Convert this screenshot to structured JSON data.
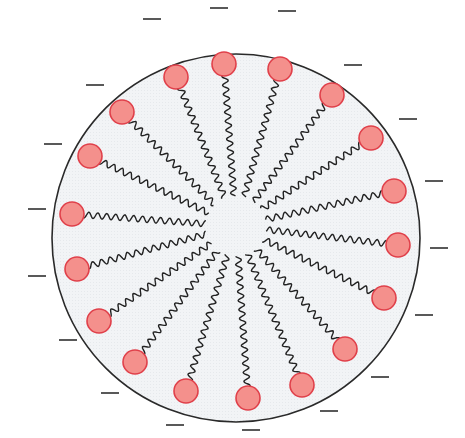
{
  "diagram": {
    "type": "micelle",
    "colors": {
      "background": "#ffffff",
      "interior": "#f2f4f6",
      "boundary": "#2a2a2a",
      "head_fill": "#f4908c",
      "head_stroke": "#e0404a",
      "tail": "#222222",
      "charge": "#222222"
    },
    "boundary": {
      "cx": 236,
      "cy": 238,
      "r": 184
    },
    "center": {
      "x": 236,
      "y": 226
    },
    "heads": [
      {
        "x": 176,
        "y": 77
      },
      {
        "x": 224,
        "y": 64
      },
      {
        "x": 280,
        "y": 69
      },
      {
        "x": 332,
        "y": 95
      },
      {
        "x": 371,
        "y": 138
      },
      {
        "x": 394,
        "y": 191
      },
      {
        "x": 398,
        "y": 245
      },
      {
        "x": 384,
        "y": 298
      },
      {
        "x": 345,
        "y": 349
      },
      {
        "x": 302,
        "y": 385
      },
      {
        "x": 248,
        "y": 398
      },
      {
        "x": 186,
        "y": 391
      },
      {
        "x": 135,
        "y": 362
      },
      {
        "x": 99,
        "y": 321
      },
      {
        "x": 77,
        "y": 269
      },
      {
        "x": 72,
        "y": 214
      },
      {
        "x": 90,
        "y": 156
      },
      {
        "x": 122,
        "y": 112
      }
    ],
    "head_radius": 12,
    "charges": [
      {
        "x": 152,
        "y": 19
      },
      {
        "x": 219,
        "y": 8
      },
      {
        "x": 287,
        "y": 11
      },
      {
        "x": 353,
        "y": 65
      },
      {
        "x": 408,
        "y": 119
      },
      {
        "x": 434,
        "y": 181
      },
      {
        "x": 439,
        "y": 248
      },
      {
        "x": 424,
        "y": 315
      },
      {
        "x": 380,
        "y": 377
      },
      {
        "x": 329,
        "y": 411
      },
      {
        "x": 251,
        "y": 430
      },
      {
        "x": 175,
        "y": 425
      },
      {
        "x": 110,
        "y": 393
      },
      {
        "x": 68,
        "y": 340
      },
      {
        "x": 37,
        "y": 276
      },
      {
        "x": 37,
        "y": 209
      },
      {
        "x": 53,
        "y": 144
      },
      {
        "x": 95,
        "y": 85
      }
    ],
    "charge_symbol": "−",
    "charge_length": 18,
    "tail_inner_gap": 30,
    "tail_wave_amplitude": 3,
    "tail_wave_period": 9
  }
}
